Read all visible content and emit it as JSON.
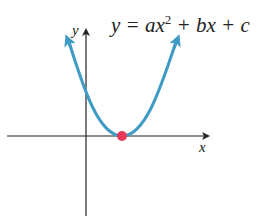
{
  "equation": {
    "lhs": "y = ax",
    "exp": "2",
    "rhs": " + bx + c"
  },
  "axes": {
    "x_label": "x",
    "y_label": "y"
  },
  "colors": {
    "curve": "#3d9bc4",
    "vertex": "#e8385a",
    "axis": "#222222"
  },
  "vertex": {
    "label": "vertex",
    "note": "single x-intercept (tangent)"
  }
}
